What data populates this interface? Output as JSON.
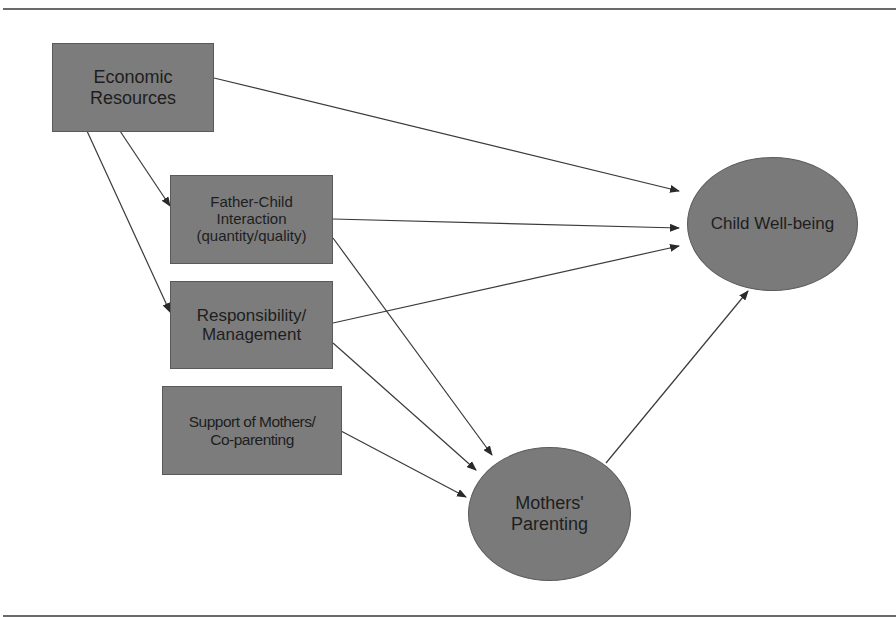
{
  "diagram": {
    "type": "path-model",
    "nodes": [
      {
        "id": "economic",
        "label": "Economic\nResources",
        "shape": "rectangle"
      },
      {
        "id": "father_child",
        "label": "Father-Child\nInteraction\n(quantity/quality)",
        "shape": "rectangle"
      },
      {
        "id": "responsibility",
        "label": "Responsibility/\nManagement",
        "shape": "rectangle"
      },
      {
        "id": "support",
        "label": "Support of Mothers/\nCo-parenting",
        "shape": "rectangle"
      },
      {
        "id": "child_wellbeing",
        "label": "Child Well-being",
        "shape": "ellipse"
      },
      {
        "id": "mothers_parenting",
        "label": "Mothers'\nParenting",
        "shape": "ellipse"
      }
    ],
    "edges": [
      {
        "from": "economic",
        "to": "child_wellbeing"
      },
      {
        "from": "economic",
        "to": "father_child"
      },
      {
        "from": "economic",
        "to": "responsibility"
      },
      {
        "from": "father_child",
        "to": "child_wellbeing"
      },
      {
        "from": "father_child",
        "to": "mothers_parenting"
      },
      {
        "from": "responsibility",
        "to": "child_wellbeing"
      },
      {
        "from": "responsibility",
        "to": "mothers_parenting"
      },
      {
        "from": "support",
        "to": "mothers_parenting"
      },
      {
        "from": "mothers_parenting",
        "to": "child_wellbeing"
      }
    ],
    "colors": {
      "node_fill": "#7c7c7c",
      "text": "#1e1e1e",
      "edge": "#3a3a3a",
      "rule": "#6a6a6a"
    }
  }
}
